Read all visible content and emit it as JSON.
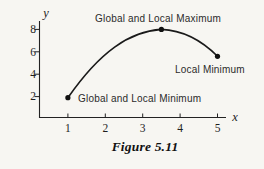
{
  "figure": {
    "caption": "Figure 5.11",
    "background_color": "#f7f6f2",
    "ink_color": "#1a1a1a"
  },
  "chart_data": {
    "type": "line",
    "title": "Figure 5.11",
    "xlabel": "x",
    "ylabel": "y",
    "xlim": [
      0,
      5.5
    ],
    "ylim": [
      0,
      9
    ],
    "grid": false,
    "x_ticks": [
      "1",
      "2",
      "3",
      "4",
      "5"
    ],
    "y_ticks": [
      "8",
      "6",
      "4",
      "2"
    ],
    "points": [
      {
        "x": 1,
        "y": 1.9,
        "label": "Global and Local Minimum"
      },
      {
        "x": 3.5,
        "y": 8,
        "label": "Global and Local Maximum"
      },
      {
        "x": 5,
        "y": 5.6,
        "label": "Local Minimum"
      }
    ]
  }
}
